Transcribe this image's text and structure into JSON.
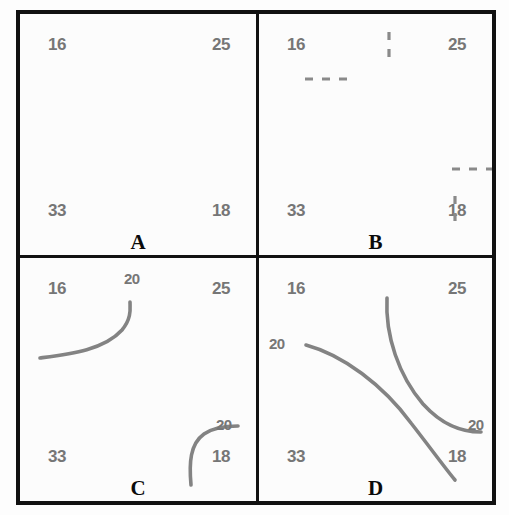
{
  "figure": {
    "background_color": "#fdfdfd",
    "frame_color": "#111111",
    "number_color": "#767676",
    "curve_color": "#838383"
  },
  "chart_data": {
    "type": "diagram",
    "title": "",
    "panels": [
      {
        "letter": "A",
        "corner_values": {
          "top_left": "16",
          "top_right": "25",
          "bottom_left": "33",
          "bottom_right": "18"
        },
        "contour_level": null,
        "contours": [],
        "dashes": []
      },
      {
        "letter": "B",
        "corner_values": {
          "top_left": "16",
          "top_right": "25",
          "bottom_left": "33",
          "bottom_right": "18"
        },
        "contour_level": null,
        "contours": [],
        "dashes": [
          {
            "name": "top-edge-crossing-tick",
            "orientation": "vertical",
            "x1": 130,
            "y1": 18,
            "x2": 130,
            "y2": 50
          },
          {
            "name": "left-edge-crossing-tick",
            "orientation": "horizontal",
            "x1": 46,
            "y1": 65,
            "x2": 88,
            "y2": 65
          },
          {
            "name": "right-edge-crossing-tick",
            "orientation": "horizontal",
            "x1": 193,
            "y1": 155,
            "x2": 241,
            "y2": 155
          },
          {
            "name": "bottom-edge-crossing-tick",
            "orientation": "vertical",
            "x1": 196,
            "y1": 182,
            "x2": 196,
            "y2": 216
          }
        ]
      },
      {
        "letter": "C",
        "corner_values": {
          "top_left": "16",
          "top_right": "25",
          "bottom_left": "33",
          "bottom_right": "18"
        },
        "contour_level": "20",
        "contours": [
          {
            "name": "upper-left-contour",
            "label": "20",
            "label_x": 104,
            "label_y": 14,
            "path": "M 20 100 C 50 96, 84 92, 102 72 C 112 60, 110 50, 110 44"
          },
          {
            "name": "lower-right-contour",
            "label": "20",
            "label_x": 196,
            "label_y": 160,
            "path": "M 171 227 C 169 205, 170 186, 184 176 C 194 169, 206 168, 218 168"
          }
        ],
        "dashes": []
      },
      {
        "letter": "D",
        "corner_values": {
          "top_left": "16",
          "top_right": "25",
          "bottom_left": "33",
          "bottom_right": "18"
        },
        "contour_level": "20",
        "contours": [
          {
            "name": "left-to-bottom-contour",
            "label": "20",
            "label_x": 10,
            "label_y": 79,
            "path": "M 47 87 C 84 97, 124 127, 152 165 C 173 192, 186 210, 196 222"
          },
          {
            "name": "top-to-right-contour",
            "label": "20",
            "label_x": 209,
            "label_y": 160,
            "path": "M 128 40 C 126 78, 140 118, 164 146 C 184 168, 203 174, 222 174"
          }
        ],
        "dashes": []
      }
    ]
  }
}
